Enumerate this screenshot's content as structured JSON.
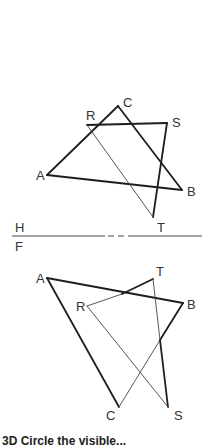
{
  "figure": {
    "type": "orthographic-projection",
    "fold_line": {
      "upper_label": "H",
      "lower_label": "F"
    },
    "top_view": {
      "name": "horizontal-view",
      "points": {
        "A": [
          47,
          175
        ],
        "B": [
          182,
          190
        ],
        "C": [
          118,
          106
        ],
        "R": [
          87,
          125
        ],
        "S": [
          167,
          123
        ],
        "T": [
          153,
          217
        ]
      },
      "labels": [
        "A",
        "B",
        "C",
        "R",
        "S",
        "T"
      ]
    },
    "front_view": {
      "name": "frontal-view",
      "points": {
        "A": [
          47,
          278
        ],
        "B": [
          183,
          303
        ],
        "C": [
          119,
          407
        ],
        "R": [
          87,
          306
        ],
        "S": [
          168,
          407
        ],
        "T": [
          153,
          279
        ]
      },
      "labels": [
        "A",
        "B",
        "C",
        "R",
        "S",
        "T"
      ]
    },
    "planes": [
      {
        "name": "ABC",
        "vertices": [
          "A",
          "B",
          "C"
        ]
      },
      {
        "name": "RST",
        "vertices": [
          "R",
          "S",
          "T"
        ]
      }
    ]
  },
  "caption": "3D   Circle the visible..."
}
